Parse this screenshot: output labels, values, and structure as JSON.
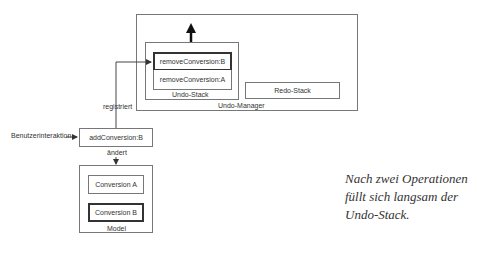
{
  "undo_manager": {
    "label": "Undo-Manager",
    "undo_stack": {
      "label": "Undo-Stack",
      "items": [
        "removeConversion:B",
        "removeConversion:A"
      ]
    },
    "redo_stack": {
      "label": "Redo-Stack"
    }
  },
  "action": {
    "label": "addConversion:B",
    "input_label": "Benutzerinteraktion",
    "registers_label": "registriert",
    "changes_label": "ändert"
  },
  "model": {
    "label": "Model",
    "items": [
      "Conversion A",
      "Conversion B"
    ]
  },
  "caption": "Nach zwei Operationen füllt sich langsam der Undo-Stack."
}
